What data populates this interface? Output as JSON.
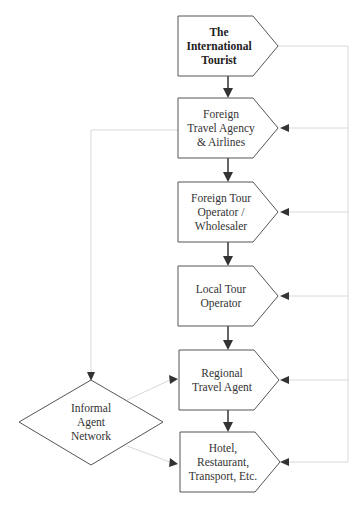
{
  "diagram": {
    "type": "flowchart",
    "colors": {
      "shape_stroke": "#555555",
      "arrow": "#333333",
      "feedback_line": "#d8d8d8",
      "text": "#333333"
    },
    "nodes": [
      {
        "id": "international-tourist",
        "shape": "pentagon-arrow",
        "lines": [
          "The",
          "International",
          "Tourist"
        ],
        "bold": true
      },
      {
        "id": "foreign-travel-agency",
        "shape": "pentagon-arrow",
        "lines": [
          "Foreign",
          "Travel Agency",
          "& Airlines"
        ]
      },
      {
        "id": "foreign-tour-operator",
        "shape": "pentagon-arrow",
        "lines": [
          "Foreign Tour",
          "Operator /",
          "Wholesaler"
        ]
      },
      {
        "id": "local-tour-operator",
        "shape": "pentagon-arrow",
        "lines": [
          "Local Tour",
          "Operator"
        ]
      },
      {
        "id": "regional-travel-agent",
        "shape": "pentagon-arrow",
        "lines": [
          "Regional",
          "Travel Agent"
        ]
      },
      {
        "id": "hotel-restaurant-transport",
        "shape": "pentagon-arrow",
        "lines": [
          "Hotel,",
          "Restaurant,",
          "Transport, Etc."
        ]
      },
      {
        "id": "informal-agent-network",
        "shape": "diamond",
        "lines": [
          "Informal",
          "Agent",
          "Network"
        ]
      }
    ],
    "edges": [
      {
        "from": "international-tourist",
        "to": "foreign-travel-agency",
        "style": "solid"
      },
      {
        "from": "foreign-travel-agency",
        "to": "foreign-tour-operator",
        "style": "solid"
      },
      {
        "from": "foreign-tour-operator",
        "to": "local-tour-operator",
        "style": "solid"
      },
      {
        "from": "local-tour-operator",
        "to": "regional-travel-agent",
        "style": "solid"
      },
      {
        "from": "regional-travel-agent",
        "to": "hotel-restaurant-transport",
        "style": "solid"
      },
      {
        "from": "international-tourist",
        "to": "foreign-travel-agency",
        "style": "dotted-feedback-right"
      },
      {
        "from": "international-tourist",
        "to": "foreign-tour-operator",
        "style": "dotted-feedback-right"
      },
      {
        "from": "international-tourist",
        "to": "local-tour-operator",
        "style": "dotted-feedback-right"
      },
      {
        "from": "international-tourist",
        "to": "regional-travel-agent",
        "style": "dotted-feedback-right"
      },
      {
        "from": "international-tourist",
        "to": "hotel-restaurant-transport",
        "style": "dotted-feedback-right"
      },
      {
        "from": "foreign-travel-agency",
        "to": "informal-agent-network",
        "style": "dotted"
      },
      {
        "from": "informal-agent-network",
        "to": "regional-travel-agent",
        "style": "dotted"
      },
      {
        "from": "informal-agent-network",
        "to": "hotel-restaurant-transport",
        "style": "dotted"
      }
    ]
  }
}
